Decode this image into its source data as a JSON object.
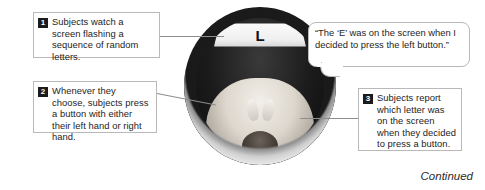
{
  "figure": {
    "continued_label": "Continued"
  },
  "steps": [
    {
      "number": "1",
      "text": "Subjects watch a screen flashing a sequence of random letters."
    },
    {
      "number": "2",
      "text": "Whenever they choose, subjects press a button with either their left hand or right hand."
    },
    {
      "number": "3",
      "text": "Subjects report which letter was on the screen when they decided to press a button."
    }
  ],
  "quote": {
    "text": "“The ‘E’ was on the screen when I decided to press the left button.”"
  },
  "scanner": {
    "screen_letter": "L"
  },
  "colors": {
    "badge_background": "#1b1b1b",
    "badge_text": "#ffffff",
    "box_border": "#b9b9b9",
    "leader_line": "#8d8d8d",
    "text": "#1d1d1d",
    "page_background": "#ffffff"
  }
}
